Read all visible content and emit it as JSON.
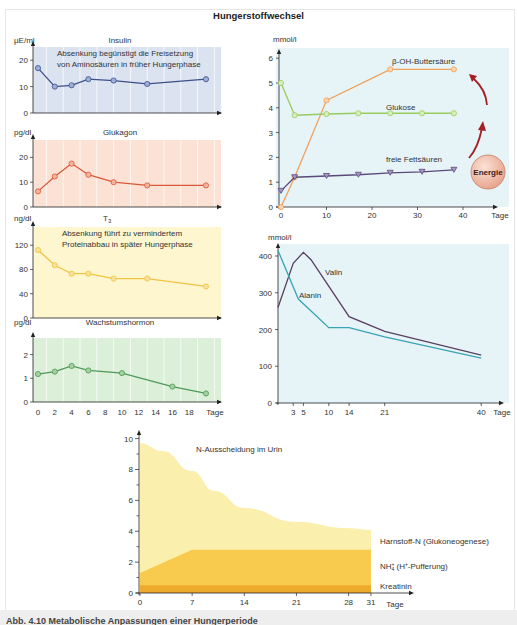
{
  "figure": {
    "title": "Hungerstoffwechsel",
    "caption": "Abb. 4.10 Metabolische Anpassungen einer Hungerperiode"
  },
  "colors": {
    "insulin_bg": "#dbe3f1",
    "insulin_line": "#3d4f88",
    "insulin_marker": "#9fb0d6",
    "glukagon_bg": "#fbe2d4",
    "glukagon_line": "#d9583a",
    "glukagon_marker": "#f1b59c",
    "t3_bg": "#fdf6cf",
    "t3_line": "#f0c443",
    "t3_marker": "#f8e29b",
    "gh_bg": "#dcefd9",
    "gh_line": "#4f9a5a",
    "gh_marker": "#a6cfa1",
    "right_bg": "#e6f4f8",
    "buttersaeure": "#f0a05a",
    "glukose": "#9acb5c",
    "fettsaeuren": "#5a4a7a",
    "fettsaeuren_marker": "#a697c4",
    "alanin": "#3aa3b3",
    "valin": "#5a4060",
    "energie_ball": "#e8a58f",
    "arrow": "#a51e22",
    "harnstoff": "#fbefad",
    "nh4": "#f8cb4e",
    "kreatinin": "#eeaa2c"
  },
  "chart_data": [
    {
      "id": "insulin",
      "type": "line",
      "title": "Insulin",
      "ylabel": "µE/ml",
      "xlabel": "Tage",
      "ylim": [
        0,
        25
      ],
      "yticks": [
        0,
        10,
        20
      ],
      "xticks": [
        0,
        2,
        4,
        6,
        8,
        10,
        12,
        14,
        16,
        18
      ],
      "xlim": [
        0,
        21
      ],
      "grid": true,
      "annotation": [
        "Absenkung begünstigt die Freisetzung",
        "von  Aminosäuren in früher Hungerphase"
      ],
      "series": [
        {
          "name": "Insulin",
          "x": [
            0,
            2,
            4,
            6,
            9,
            13,
            20
          ],
          "values": [
            17,
            10,
            10.5,
            12.8,
            12.3,
            11,
            12.8
          ]
        }
      ]
    },
    {
      "id": "glukagon",
      "type": "line",
      "title": "Glukagon",
      "ylabel": "pg/dl",
      "xlabel": "Tage",
      "ylim": [
        0,
        27
      ],
      "yticks": [
        0,
        10,
        20
      ],
      "xticks": [
        0,
        2,
        4,
        6,
        8,
        10,
        12,
        14,
        16,
        18
      ],
      "xlim": [
        0,
        21
      ],
      "grid": true,
      "series": [
        {
          "name": "Glukagon",
          "x": [
            0,
            2,
            4,
            6,
            9,
            13,
            20
          ],
          "values": [
            6.3,
            12.3,
            17.5,
            13,
            10,
            8.7,
            8.7
          ]
        }
      ]
    },
    {
      "id": "t3",
      "type": "line",
      "title": "T3",
      "title_main": "T",
      "title_sub": "3",
      "ylabel": "ng/dl",
      "xlabel": "Tage",
      "ylim": [
        0,
        150
      ],
      "yticks": [
        0,
        40,
        80,
        120
      ],
      "xticks": [
        0,
        2,
        4,
        6,
        8,
        10,
        12,
        14,
        16,
        18
      ],
      "xlim": [
        0,
        21
      ],
      "grid": false,
      "annotation": [
        "Absenkung führt zu vermindertem",
        "Proteinabbau in später Hungerphase"
      ],
      "series": [
        {
          "name": "T3",
          "x": [
            0,
            2,
            4,
            6,
            9,
            13,
            20
          ],
          "values": [
            112,
            87,
            73,
            73,
            65,
            65,
            52
          ]
        }
      ]
    },
    {
      "id": "wachstumshormon",
      "type": "line",
      "title": "Wachstumshormon",
      "ylabel": "pg/dl",
      "xlabel": "Tage",
      "ylim": [
        0,
        2.7
      ],
      "yticks": [
        0,
        1,
        2
      ],
      "xticks": [
        0,
        2,
        4,
        6,
        8,
        10,
        12,
        14,
        16,
        18
      ],
      "xlim": [
        0,
        21
      ],
      "grid": true,
      "series": [
        {
          "name": "Wachstumshormon",
          "x": [
            0,
            2,
            4,
            6,
            10,
            16,
            20
          ],
          "values": [
            1.18,
            1.28,
            1.52,
            1.33,
            1.22,
            0.65,
            0.36
          ]
        }
      ]
    },
    {
      "id": "metabolite",
      "type": "line",
      "title": "",
      "ylabel": "mmol/l",
      "xlabel": "Tage",
      "ylim": [
        0,
        6.5
      ],
      "yticks": [
        0,
        1,
        2,
        3,
        4,
        5,
        6
      ],
      "xticks": [
        0,
        10,
        20,
        30,
        40
      ],
      "xlim": [
        0,
        44
      ],
      "energy_label": "Energie",
      "series": [
        {
          "name": "β-OH-Buttersäure",
          "x": [
            0,
            3,
            10,
            24,
            38
          ],
          "values": [
            0,
            1.2,
            4.3,
            5.55,
            5.55
          ]
        },
        {
          "name": "Glukose",
          "x": [
            0,
            3,
            10,
            17,
            24,
            31,
            38
          ],
          "values": [
            5.0,
            3.7,
            3.75,
            3.78,
            3.78,
            3.78,
            3.78
          ]
        },
        {
          "name": "freie Fettsäuren",
          "x": [
            0,
            3,
            10,
            17,
            24,
            31,
            38
          ],
          "values": [
            0.65,
            1.2,
            1.25,
            1.3,
            1.38,
            1.42,
            1.5
          ]
        }
      ]
    },
    {
      "id": "aminosaeuren",
      "type": "line",
      "title": "",
      "ylabel": "mmol/l",
      "xlabel": "Tage",
      "ylim": [
        0,
        430
      ],
      "yticks": [
        0,
        100,
        200,
        300,
        400
      ],
      "xticks": [
        3,
        5,
        10,
        14,
        21,
        40
      ],
      "xlim": [
        0,
        43
      ],
      "series": [
        {
          "name": "Valin",
          "x": [
            0,
            3,
            5,
            6.5,
            14,
            21,
            40
          ],
          "values": [
            260,
            380,
            410,
            390,
            235,
            195,
            130
          ]
        },
        {
          "name": "Alanin",
          "x": [
            0,
            4,
            10,
            14,
            21,
            40
          ],
          "values": [
            415,
            283,
            205,
            205,
            180,
            122
          ]
        }
      ]
    },
    {
      "id": "n-ausscheidung",
      "type": "area",
      "title": "N-Ausscheidung im Urin",
      "ylabel": "",
      "xlabel": "Tage",
      "ylim": [
        0,
        10.5
      ],
      "yticks": [
        0,
        2,
        4,
        6,
        8,
        10
      ],
      "xticks": [
        0,
        7,
        14,
        21,
        28,
        31
      ],
      "xlim": [
        0,
        35
      ],
      "stacked": true,
      "series": [
        {
          "name": "Kreatinin",
          "x": [
            0,
            7,
            14,
            21,
            28,
            31
          ],
          "values": [
            0.5,
            0.5,
            0.5,
            0.5,
            0.5,
            0.5
          ]
        },
        {
          "name": "NH4+ (H+-Pufferung)",
          "label_main": "NH",
          "label_sub": "4",
          "label_sup": "+",
          "label_rest": " (H",
          "label_sup2": "+",
          "label_end": "-Pufferung)",
          "x": [
            0,
            7,
            14,
            21,
            28,
            31
          ],
          "totals": [
            1.3,
            2.8,
            2.8,
            2.8,
            2.8,
            2.8
          ]
        },
        {
          "name": "Harnstoff-N (Glukoneogenese)",
          "x": [
            0,
            3,
            7,
            10,
            14,
            21,
            28,
            31
          ],
          "totals": [
            9.7,
            9.2,
            7.9,
            6.6,
            5.5,
            4.6,
            4.2,
            4.1
          ]
        }
      ]
    }
  ]
}
